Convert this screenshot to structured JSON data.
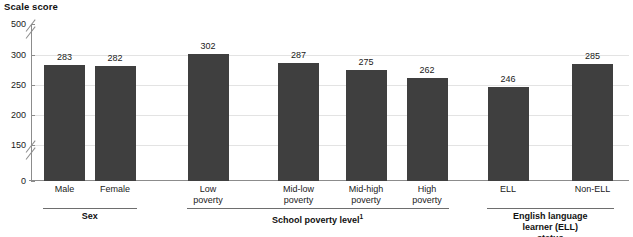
{
  "chart_data": {
    "type": "bar",
    "title": "Scale score",
    "xlabel": "",
    "ylabel": "Scale score",
    "grid": true,
    "legend": null,
    "ylim": [
      0,
      500
    ],
    "yticks": [
      500,
      300,
      250,
      200,
      150,
      0
    ],
    "axis_breaks": [
      "300-500",
      "0-150"
    ],
    "categories": [
      "Male",
      "Female",
      "Low\npoverty",
      "Mid-low\npoverty",
      "Mid-high\npoverty",
      "High\npoverty",
      "ELL",
      "Non-ELL"
    ],
    "values": [
      283,
      282,
      302,
      287,
      275,
      262,
      246,
      285
    ],
    "groups": [
      {
        "label": "Sex",
        "footnote": "",
        "start": 0,
        "end": 1
      },
      {
        "label": "School poverty level",
        "footnote": "1",
        "start": 2,
        "end": 5
      },
      {
        "label": "English language\nlearner (ELL) status",
        "footnote": "",
        "start": 6,
        "end": 7
      }
    ],
    "bar_color": "#3f3f3f",
    "grid_color": "#e3e3e3",
    "axis_color": "#8c8c8c"
  }
}
